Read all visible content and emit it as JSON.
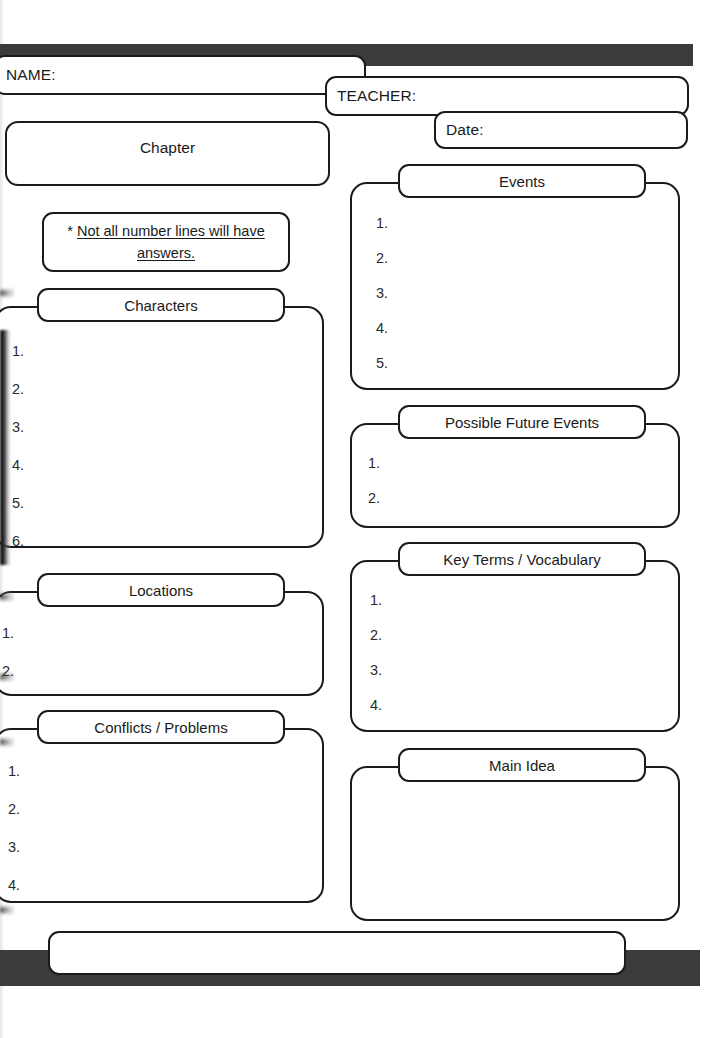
{
  "document": {
    "title": "Chapter Reading Graphic Organizer Worksheet",
    "paper_color": "#ffffff",
    "ink_color": "#1b1b1b",
    "bar_color": "#3b3b3b"
  },
  "header": {
    "name_label": "NAME:",
    "name_value": "",
    "teacher_label": "TEACHER:",
    "teacher_value": "",
    "date_label": "Date:",
    "date_value": ""
  },
  "chapter": {
    "title": "Chapter",
    "value": ""
  },
  "note": {
    "marker": "*",
    "line1": "Not all number lines will have",
    "line2": "answers."
  },
  "left_column": {
    "sections": [
      {
        "title": "Characters",
        "items": [
          "1.",
          "2.",
          "3.",
          "4.",
          "5.",
          "6."
        ],
        "item_count": 6
      },
      {
        "title": "Locations",
        "items": [
          "1.",
          "2."
        ],
        "item_count": 2
      },
      {
        "title": "Conflicts / Problems",
        "items": [
          "1.",
          "2.",
          "3.",
          "4."
        ],
        "item_count": 4
      }
    ]
  },
  "right_column": {
    "sections": [
      {
        "title": "Events",
        "items": [
          "1.",
          "2.",
          "3.",
          "4.",
          "5."
        ],
        "item_count": 5
      },
      {
        "title": "Possible Future Events",
        "items": [
          "1.",
          "2."
        ],
        "item_count": 2
      },
      {
        "title": "Key Terms / Vocabulary",
        "items": [
          "1.",
          "2.",
          "3.",
          "4."
        ],
        "item_count": 4
      },
      {
        "title": "Main Idea",
        "items": [],
        "item_count": 0
      }
    ]
  },
  "footer": {
    "strip_value": ""
  }
}
